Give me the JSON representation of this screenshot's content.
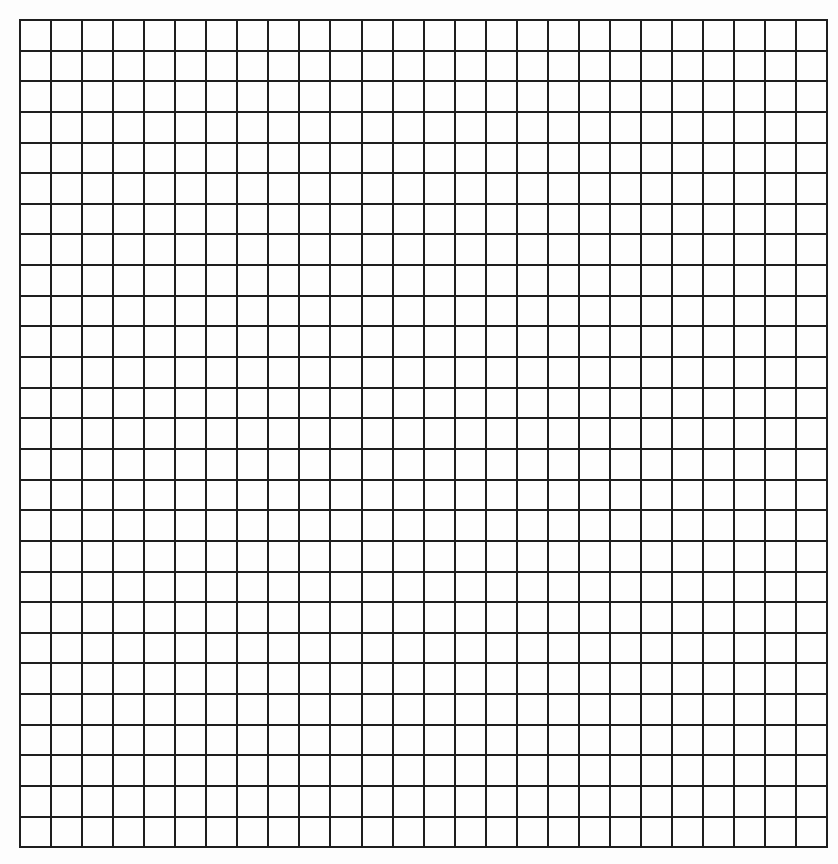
{
  "page": {
    "type": "blank-grid-paper",
    "background": "#fdfdfd",
    "line_color": "#1e1e1e"
  },
  "grid": {
    "columns": 26,
    "rows": 27,
    "left": 19,
    "top": 19,
    "cell_width": 31.05,
    "cell_height": 30.65,
    "line_width": 2
  }
}
